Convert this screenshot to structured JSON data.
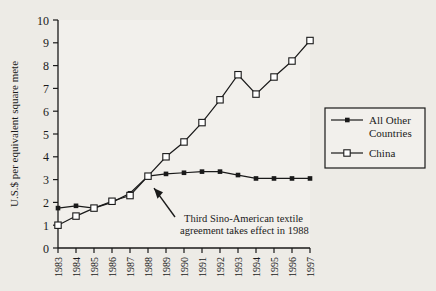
{
  "chart_data": {
    "type": "line",
    "title": "",
    "xlabel": "",
    "ylabel": "U.S.$ per equivalent square mete",
    "categories": [
      "1983",
      "1984",
      "1985",
      "1986",
      "1987",
      "1988",
      "1989",
      "1990",
      "1991",
      "1992",
      "1993",
      "1994",
      "1995",
      "1996",
      "1997"
    ],
    "xlim": [
      1983,
      1997
    ],
    "ylim": [
      0,
      10
    ],
    "yticks": [
      0,
      1,
      2,
      3,
      4,
      5,
      6,
      7,
      8,
      9,
      10
    ],
    "grid": false,
    "legend_position": "right",
    "series": [
      {
        "name": "All Other Countries",
        "marker": "filled-square",
        "values": [
          1.75,
          1.85,
          1.75,
          2.0,
          2.4,
          3.15,
          3.25,
          3.3,
          3.35,
          3.35,
          3.2,
          3.05,
          3.05,
          3.05,
          3.05
        ]
      },
      {
        "name": "China",
        "marker": "open-square",
        "values": [
          1.0,
          1.4,
          1.75,
          2.05,
          2.3,
          3.15,
          4.0,
          4.65,
          5.5,
          6.5,
          7.6,
          6.75,
          7.5,
          8.2,
          9.1
        ]
      }
    ],
    "annotations": [
      {
        "text_line1": "Third Sino-American textile",
        "text_line2": "agreement takes effect in 1988",
        "points_to_year": "1988"
      }
    ]
  },
  "legend": {
    "items": [
      {
        "label_line1": "All Other",
        "label_line2": "Countries",
        "marker": "filled-square"
      },
      {
        "label_line1": "China",
        "label_line2": "",
        "marker": "open-square"
      }
    ]
  },
  "colors": {
    "background": "#edebe6",
    "ink": "#1a1a1a",
    "plot_background": "#f2f0ec"
  }
}
